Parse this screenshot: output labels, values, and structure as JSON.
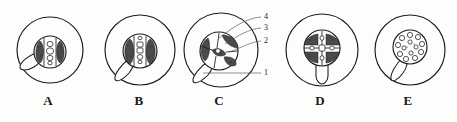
{
  "figure": {
    "title_visible": false,
    "background_color": "#fdfdfc",
    "ink_color": "#1c1c1c",
    "panel_count": 5,
    "callout_count": 4
  },
  "panels": [
    {
      "caption": "A",
      "caption_x": 48,
      "caption_y": 101,
      "outer_cx": 50,
      "outer_cy": 50,
      "outer_r": 33,
      "stele_cx": 50,
      "stele_cy": 52,
      "stele_r": 16,
      "pattern": "two-lateral-dark-patches-with-central-cell-column",
      "tail": "lower-left-lobe"
    },
    {
      "caption": "B",
      "caption_x": 139,
      "caption_y": 101,
      "outer_cx": 140,
      "outer_cy": 50,
      "outer_r": 35,
      "stele_cx": 140,
      "stele_cy": 52,
      "stele_r": 17,
      "pattern": "two-lateral-dark-patches-with-central-cell-column",
      "tail": "lower-left-lobe"
    },
    {
      "caption": "C",
      "caption_x": 219,
      "caption_y": 101,
      "outer_cx": 221,
      "outer_cy": 50,
      "outer_r": 37,
      "stele_cx": 219,
      "stele_cy": 52,
      "stele_r": 19,
      "pattern": "radiating-dark-sectors",
      "tail": "lower-left-lobe"
    },
    {
      "caption": "D",
      "caption_x": 320,
      "caption_y": 101,
      "outer_cx": 322,
      "outer_cy": 50,
      "outer_r": 36,
      "stele_cx": 322,
      "stele_cy": 48,
      "stele_r": 18,
      "pattern": "cross-shaped-stele-four-dark-quadrants",
      "tail": "downward-pointed-lobe"
    },
    {
      "caption": "E",
      "caption_x": 408,
      "caption_y": 101,
      "outer_cx": 410,
      "outer_cy": 50,
      "outer_r": 35,
      "stele_cx": 410,
      "stele_cy": 47,
      "stele_r": 17,
      "pattern": "peripheral-ring-of-round-cells",
      "tail": "lower-left-lobe"
    }
  ],
  "callouts": [
    {
      "label": "4",
      "label_x": 264,
      "label_y": 17,
      "leader_to_x": 219,
      "leader_to_y": 38
    },
    {
      "label": "3",
      "label_x": 264,
      "label_y": 28,
      "leader_to_x": 224,
      "leader_to_y": 44
    },
    {
      "label": "2",
      "label_x": 264,
      "label_y": 41,
      "leader_to_x": 228,
      "leader_to_y": 52
    },
    {
      "label": "1",
      "label_x": 264,
      "label_y": 73,
      "leader_to_x": 204,
      "leader_to_y": 72
    }
  ]
}
